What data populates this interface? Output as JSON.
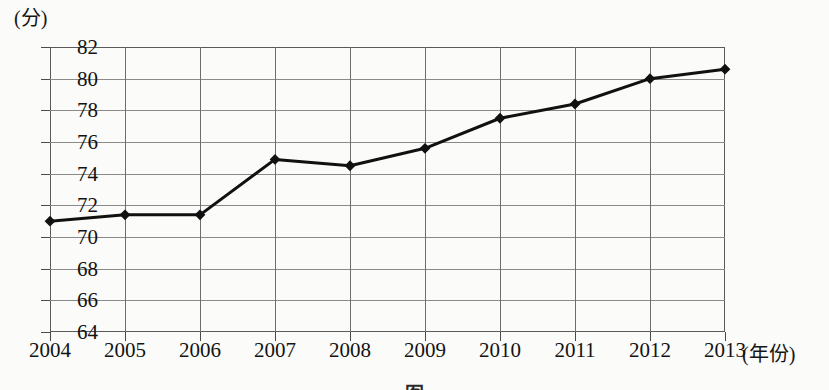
{
  "chart_data": {
    "type": "line",
    "title": "",
    "xlabel": "(年份)",
    "ylabel": "(分)",
    "categories": [
      "2004",
      "2005",
      "2006",
      "2007",
      "2008",
      "2009",
      "2010",
      "2011",
      "2012",
      "2013"
    ],
    "values": [
      71.0,
      71.4,
      71.4,
      74.9,
      74.5,
      75.6,
      77.5,
      78.4,
      80.0,
      80.6
    ],
    "series": [
      {
        "name": "",
        "values": [
          71.0,
          71.4,
          71.4,
          74.9,
          74.5,
          75.6,
          77.5,
          78.4,
          80.0,
          80.6
        ]
      }
    ],
    "ylim": [
      64,
      82
    ],
    "ytick_labels": [
      "82",
      "80",
      "78",
      "76",
      "74",
      "72",
      "70",
      "68",
      "66",
      "64"
    ],
    "ytick_values": [
      82,
      80,
      78,
      76,
      74,
      72,
      70,
      68,
      66,
      64
    ],
    "xtick_labels": [
      "2004",
      "2005",
      "2006",
      "2007",
      "2008",
      "2009",
      "2010",
      "2011",
      "2012",
      "2013"
    ],
    "grid": true,
    "legend": "none",
    "line_color": "#111111",
    "marker": "diamond",
    "marker_color": "#111111",
    "gridline_color": "#8a8a8a",
    "axis_color": "#5a5a5a"
  },
  "caption": {
    "text": "图"
  }
}
